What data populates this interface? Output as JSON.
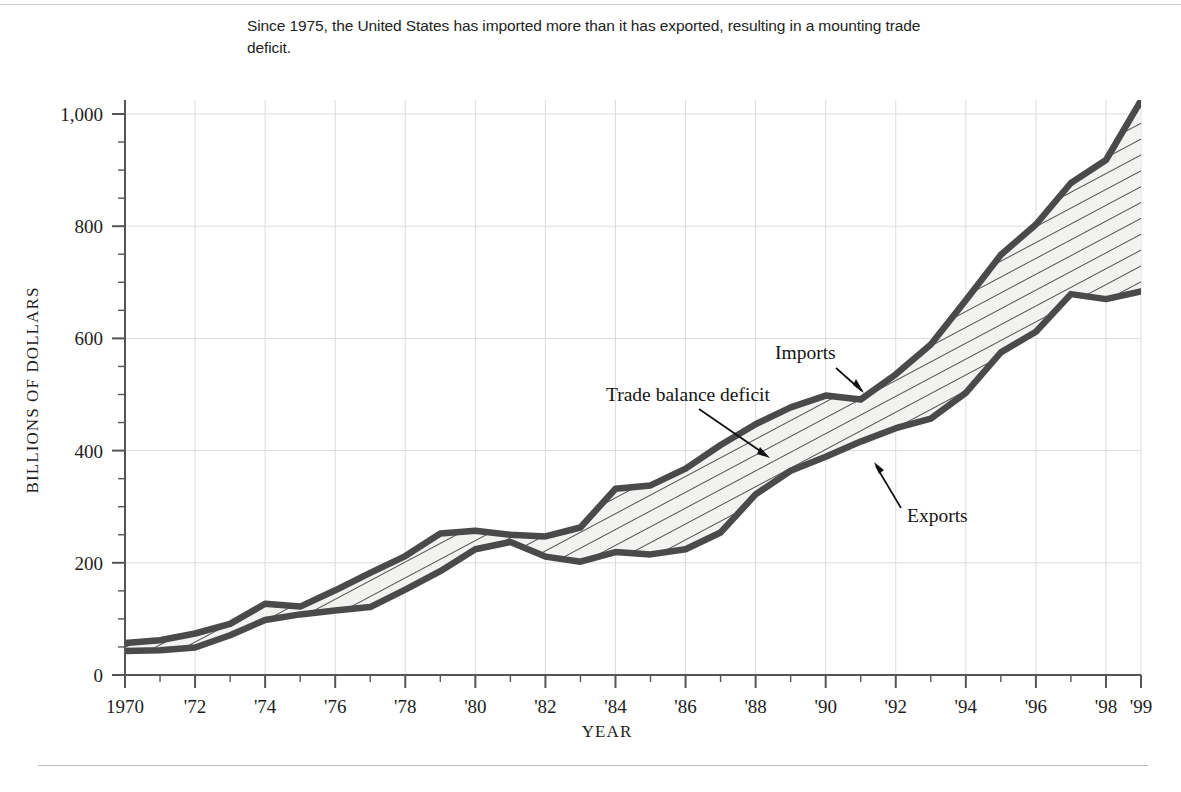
{
  "caption": {
    "text": "Since 1975, the United States has imported more than it has exported, resulting in a mounting trade deficit."
  },
  "axes": {
    "y_title": "BILLIONS OF DOLLARS",
    "x_title": "YEAR",
    "y_ticks": [
      "0",
      "200",
      "400",
      "600",
      "800",
      "1,000"
    ],
    "x_ticks": [
      "1970",
      "'72",
      "'74",
      "'76",
      "'78",
      "'80",
      "'82",
      "'84",
      "'86",
      "'88",
      "'90",
      "'92",
      "'94",
      "'96",
      "'98",
      "'99"
    ]
  },
  "annotations": {
    "imports": "Imports",
    "exports": "Exports",
    "deficit": "Trade balance deficit"
  },
  "colors": {
    "line": "#4a4a4a",
    "fill": "#f2f2f0",
    "hatch": "#4a4a4a",
    "grid": "#dcdcdc",
    "axis": "#555555",
    "text": "#1a1a1a"
  },
  "chart_data": {
    "type": "area",
    "title": "",
    "subtitle": "Since 1975, the United States has imported more than it has exported, resulting in a mounting trade deficit.",
    "xlabel": "YEAR",
    "ylabel": "BILLIONS OF DOLLARS",
    "xlim": [
      1970,
      1999
    ],
    "ylim": [
      0,
      1050
    ],
    "y_tick_values": [
      0,
      200,
      400,
      600,
      800,
      1000
    ],
    "y_minor_tick_step": 50,
    "x_tick_values": [
      1970,
      1972,
      1974,
      1976,
      1978,
      1980,
      1982,
      1984,
      1986,
      1988,
      1990,
      1992,
      1994,
      1996,
      1998,
      1999
    ],
    "x_minor_tick_step": 1,
    "grid": true,
    "legend": "annotated-inline",
    "x": [
      1970,
      1971,
      1972,
      1973,
      1974,
      1975,
      1976,
      1977,
      1978,
      1979,
      1980,
      1981,
      1982,
      1983,
      1984,
      1985,
      1986,
      1987,
      1988,
      1989,
      1990,
      1991,
      1992,
      1993,
      1994,
      1995,
      1996,
      1997,
      1998,
      1999
    ],
    "series": [
      {
        "name": "Imports",
        "values": [
          57,
          62,
          74,
          91,
          127,
          122,
          151,
          182,
          212,
          252,
          257,
          250,
          247,
          263,
          332,
          338,
          368,
          410,
          447,
          477,
          498,
          491,
          536,
          589,
          668,
          749,
          803,
          877,
          918,
          1024
        ]
      },
      {
        "name": "Exports",
        "values": [
          43,
          44,
          49,
          71,
          98,
          108,
          115,
          121,
          152,
          185,
          224,
          237,
          211,
          202,
          219,
          215,
          224,
          254,
          322,
          364,
          389,
          416,
          440,
          457,
          503,
          575,
          612,
          679,
          670,
          684
        ]
      }
    ],
    "annotations": [
      {
        "label": "Imports",
        "points_to_series": "Imports",
        "at_year": 1989
      },
      {
        "label": "Exports",
        "points_to_series": "Exports",
        "at_year": 1992
      },
      {
        "label": "Trade balance deficit",
        "points_to_series": "area-between",
        "at_year": 1987
      }
    ]
  }
}
